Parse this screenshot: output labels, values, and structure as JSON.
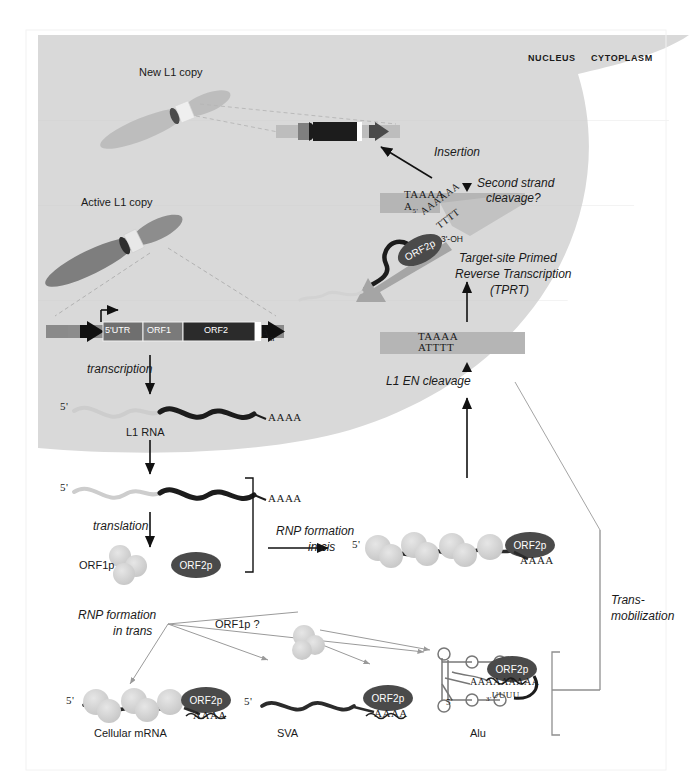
{
  "figure": {
    "compartments": {
      "nucleus_label": "NUCLEUS",
      "cytoplasm_label": "CYTOPLASM"
    },
    "colors": {
      "nucleus_fill": "#d9d9d9",
      "chromosome_dark": "#7a7a7a",
      "chromosome_light": "#c0c0c0",
      "orf2p_fill": "#4a4a4a",
      "orf1p_fill": "#cfcfcf",
      "dna_band": "#b3b3b3",
      "rna_dark": "#222222",
      "rna_light": "#bdbdbd",
      "arrow": "#111111",
      "thin_guide": "#9a9a9a"
    }
  },
  "nucleus": {
    "new_copy_label": "New L1 copy",
    "active_copy_label": "Active L1 copy",
    "insertion_label": "Insertion",
    "second_strand_label_line1": "Second strand",
    "second_strand_label_line2": "cleavage?",
    "target_site_line1": "Target-site Primed",
    "target_site_line2": "Reverse Transcription",
    "target_site_line3": "(TPRT)",
    "en_cleavage_label": "L1 EN cleavage",
    "target_dna_top_strand": "TAAAA",
    "target_dna_bottom_strand": "ATTTT",
    "nicked_top_strand": "TAAAA",
    "nicked_bottom_strand": "A",
    "nicked_bottom_sub": "5'",
    "poly_a_primer": "AAAAAA",
    "poly_t_template": "TTTT",
    "three_prime_oh": "3'-OH"
  },
  "gene_structure": {
    "segments": [
      {
        "name": "5'UTR",
        "label": "5'UTR"
      },
      {
        "name": "ORF1",
        "label": "ORF1"
      },
      {
        "name": "ORF2",
        "label": "ORF2"
      }
    ],
    "polya_label": "A",
    "polya_sub": "n",
    "transcription_label": "transcription"
  },
  "rna": {
    "five_prime": "5'",
    "poly_a": "AAAA",
    "l1_rna_label": "L1 RNA"
  },
  "cytoplasm": {
    "translation_label": "translation",
    "orf1p_label": "ORF1p",
    "orf2p_label": "ORF2p",
    "rnp_cis_line1": "RNP formation",
    "rnp_cis_line2": "in cis",
    "rnp_trans_line1": "RNP formation",
    "rnp_trans_line2": "in trans",
    "orf1p_question_label": "ORF1p ?",
    "trans_mobilization_line1": "Trans-",
    "trans_mobilization_line2": "mobilization"
  },
  "substrates": [
    {
      "name": "cellular-mrna",
      "label": "Cellular mRNA",
      "five_prime": "5'",
      "poly_a": "AAAA",
      "protein": "ORF2p"
    },
    {
      "name": "sva",
      "label": "SVA",
      "five_prime": "5'",
      "poly_a": "AAAA",
      "protein": "ORF2p"
    },
    {
      "name": "alu",
      "label": "Alu",
      "five_prime": "5'",
      "poly_a": "AAAAAAAAA",
      "poly_u": "UUUU",
      "poly_u_prefix": "3'",
      "protein": "ORF2p"
    }
  ],
  "cis_rnp": {
    "five_prime": "5'",
    "poly_a": "AAAA",
    "protein": "ORF2p"
  }
}
